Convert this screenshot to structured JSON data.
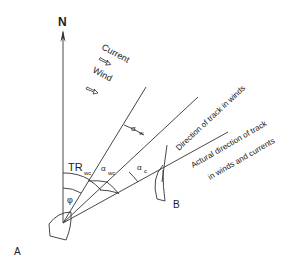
{
  "diagram": {
    "title": "",
    "north_label": "N",
    "legend": {
      "current_label": "Current",
      "wind_label": "Wind"
    },
    "points": {
      "start_label": "A",
      "end_label": "B"
    },
    "angles": {
      "tr_label": "TR",
      "tr_sub": "wc",
      "phi_label": "φ",
      "alpha_w": "α",
      "alpha_w_sub": "w",
      "alpha_wc": "α",
      "alpha_wc_sub": "wc",
      "alpha_c": "α",
      "alpha_c_sub": "c"
    },
    "lines": {
      "track_in_winds_label": "Direction of track in winds",
      "actual_track_line1": "Actural direction of track",
      "actual_track_line2": "in winds and currents"
    },
    "colors": {
      "line": "#333333",
      "text": "#222222",
      "background": "#ffffff"
    }
  }
}
